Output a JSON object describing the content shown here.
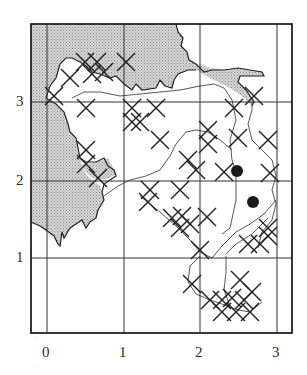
{
  "figure": {
    "type": "gridded distribution map",
    "colors": {
      "sea": "#c9c9c9",
      "frame": "#222222",
      "grid": "#333333",
      "marker": "#1a1a1a"
    }
  },
  "axes": {
    "x_ticks": [
      {
        "label": "0",
        "px": 47
      },
      {
        "label": "1",
        "px": 124
      },
      {
        "label": "2",
        "px": 200
      },
      {
        "label": "3",
        "px": 277
      }
    ],
    "y_ticks": [
      {
        "label": "3",
        "py": 102
      },
      {
        "label": "2",
        "py": 181
      },
      {
        "label": "1",
        "py": 258
      }
    ]
  },
  "legend": {
    "cross_marker": "x-cross record",
    "dot_marker": "filled-dot record"
  },
  "markers": {
    "dots": [
      {
        "x": 2.46,
        "y": 2.12
      },
      {
        "x": 2.68,
        "y": 1.72
      }
    ]
  }
}
